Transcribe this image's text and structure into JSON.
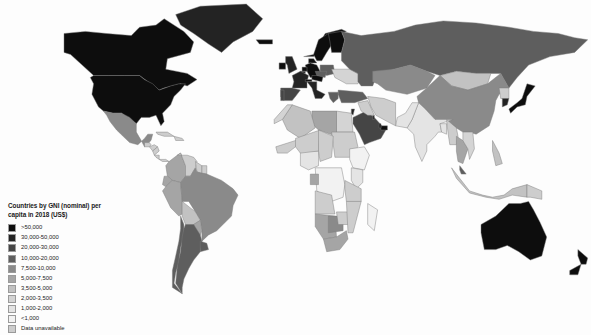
{
  "map": {
    "name": "world-choropleth-gni-per-capita-2018",
    "projection": "equirectangular",
    "background_color": "#fdfdfd",
    "ocean_color": "#ffffff",
    "border_color": "#7a7a7a"
  },
  "legend": {
    "title": "Countries by GNI (nominal) per capita in 2018 (US$)",
    "title_line1": "Countries by GNI (nominal) per",
    "title_line2": "capita in 2018 (US$)",
    "entries": [
      {
        "label": ">50,000",
        "color": "#0d0d0d"
      },
      {
        "label": "30,000-50,000",
        "color": "#232323"
      },
      {
        "label": "20,000-30,000",
        "color": "#454545"
      },
      {
        "label": "10,000-20,000",
        "color": "#5e5e5e"
      },
      {
        "label": "7,500-10,000",
        "color": "#8a8a8a"
      },
      {
        "label": "5,000-7,500",
        "color": "#a5a5a5"
      },
      {
        "label": "3,500-5,000",
        "color": "#c2c2c2"
      },
      {
        "label": "2,000-3,500",
        "color": "#d4d4d4"
      },
      {
        "label": "1,000-2,000",
        "color": "#e4e4e4"
      },
      {
        "label": "<1,000",
        "color": "#f2f2f2"
      },
      {
        "label": "Data unavailable",
        "color": "#cdcdcd"
      }
    ]
  },
  "chart_data": {
    "type": "map",
    "title": "Countries by GNI (nominal) per capita in 2018 (US$)",
    "legend_position": "bottom-left",
    "scale_kind": "sequential-grayscale-binned",
    "bins": [
      ">50,000",
      "30,000-50,000",
      "20,000-30,000",
      "10,000-20,000",
      "7,500-10,000",
      "5,000-7,500",
      "3,500-5,000",
      "2,000-3,500",
      "1,000-2,000",
      "<1,000",
      "Data unavailable"
    ],
    "regions": [
      {
        "name": "United States",
        "bin": ">50,000"
      },
      {
        "name": "Canada",
        "bin": ">50,000"
      },
      {
        "name": "Australia",
        "bin": ">50,000"
      },
      {
        "name": "New Zealand",
        "bin": ">50,000"
      },
      {
        "name": "Japan",
        "bin": ">50,000"
      },
      {
        "name": "South Korea",
        "bin": "30,000-50,000"
      },
      {
        "name": "Norway",
        "bin": ">50,000"
      },
      {
        "name": "Sweden",
        "bin": ">50,000"
      },
      {
        "name": "Denmark",
        "bin": ">50,000"
      },
      {
        "name": "Finland",
        "bin": ">50,000"
      },
      {
        "name": "Iceland",
        "bin": ">50,000"
      },
      {
        "name": "United Kingdom",
        "bin": "30,000-50,000"
      },
      {
        "name": "Ireland",
        "bin": ">50,000"
      },
      {
        "name": "Germany",
        "bin": ">50,000"
      },
      {
        "name": "France",
        "bin": "30,000-50,000"
      },
      {
        "name": "Netherlands",
        "bin": ">50,000"
      },
      {
        "name": "Belgium",
        "bin": "30,000-50,000"
      },
      {
        "name": "Switzerland",
        "bin": ">50,000"
      },
      {
        "name": "Austria",
        "bin": ">50,000"
      },
      {
        "name": "Italy",
        "bin": "30,000-50,000"
      },
      {
        "name": "Spain",
        "bin": "20,000-30,000"
      },
      {
        "name": "Portugal",
        "bin": "20,000-30,000"
      },
      {
        "name": "Poland",
        "bin": "10,000-20,000"
      },
      {
        "name": "Czechia",
        "bin": "10,000-20,000"
      },
      {
        "name": "Greece",
        "bin": "10,000-20,000"
      },
      {
        "name": "Russia",
        "bin": "10,000-20,000"
      },
      {
        "name": "Ukraine",
        "bin": "2,000-3,500"
      },
      {
        "name": "Turkey",
        "bin": "10,000-20,000"
      },
      {
        "name": "Saudi Arabia",
        "bin": "20,000-30,000"
      },
      {
        "name": "United Arab Emirates",
        "bin": ">50,000"
      },
      {
        "name": "Qatar",
        "bin": ">50,000"
      },
      {
        "name": "Kuwait",
        "bin": "30,000-50,000"
      },
      {
        "name": "Israel",
        "bin": "30,000-50,000"
      },
      {
        "name": "China",
        "bin": "7,500-10,000"
      },
      {
        "name": "Mongolia",
        "bin": "3,500-5,000"
      },
      {
        "name": "India",
        "bin": "1,000-2,000"
      },
      {
        "name": "Pakistan",
        "bin": "1,000-2,000"
      },
      {
        "name": "Bangladesh",
        "bin": "1,000-2,000"
      },
      {
        "name": "Indonesia",
        "bin": "3,500-5,000"
      },
      {
        "name": "Malaysia",
        "bin": "10,000-20,000"
      },
      {
        "name": "Thailand",
        "bin": "5,000-7,500"
      },
      {
        "name": "Vietnam",
        "bin": "2,000-3,500"
      },
      {
        "name": "Philippines",
        "bin": "3,500-5,000"
      },
      {
        "name": "Mexico",
        "bin": "7,500-10,000"
      },
      {
        "name": "Brazil",
        "bin": "7,500-10,000"
      },
      {
        "name": "Argentina",
        "bin": "10,000-20,000"
      },
      {
        "name": "Chile",
        "bin": "10,000-20,000"
      },
      {
        "name": "Uruguay",
        "bin": "10,000-20,000"
      },
      {
        "name": "Colombia",
        "bin": "5,000-7,500"
      },
      {
        "name": "Peru",
        "bin": "5,000-7,500"
      },
      {
        "name": "Venezuela",
        "bin": "Data unavailable"
      },
      {
        "name": "Bolivia",
        "bin": "3,500-5,000"
      },
      {
        "name": "Paraguay",
        "bin": "5,000-7,500"
      },
      {
        "name": "Ecuador",
        "bin": "5,000-7,500"
      },
      {
        "name": "Greenland",
        "bin": "30,000-50,000"
      },
      {
        "name": "South Africa",
        "bin": "5,000-7,500"
      },
      {
        "name": "Botswana",
        "bin": "7,500-10,000"
      },
      {
        "name": "Namibia",
        "bin": "5,000-7,500"
      },
      {
        "name": "Nigeria",
        "bin": "1,000-2,000"
      },
      {
        "name": "Egypt",
        "bin": "2,000-3,500"
      },
      {
        "name": "Algeria",
        "bin": "3,500-5,000"
      },
      {
        "name": "Libya",
        "bin": "5,000-7,500"
      },
      {
        "name": "Morocco",
        "bin": "2,000-3,500"
      },
      {
        "name": "Ethiopia",
        "bin": "<1,000"
      },
      {
        "name": "Kenya",
        "bin": "1,000-2,000"
      },
      {
        "name": "DR Congo",
        "bin": "<1,000"
      },
      {
        "name": "Gabon",
        "bin": "5,000-7,500"
      },
      {
        "name": "Madagascar",
        "bin": "<1,000"
      },
      {
        "name": "Kazakhstan",
        "bin": "7,500-10,000"
      }
    ]
  }
}
